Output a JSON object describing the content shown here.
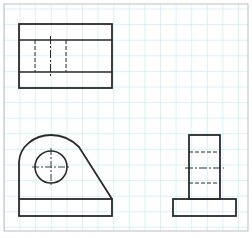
{
  "drawing": {
    "type": "orthographic-projection",
    "grid": {
      "spacing": 15.6,
      "color": "#a8e4ec",
      "background": "#ffffff"
    },
    "frame": {
      "x": 4,
      "y": 4,
      "width": 244,
      "height": 227,
      "color": "#bdbdbd"
    },
    "line_color": "#2a2a2a",
    "views": [
      {
        "name": "top-view"
      },
      {
        "name": "front-view"
      },
      {
        "name": "side-view"
      }
    ]
  }
}
